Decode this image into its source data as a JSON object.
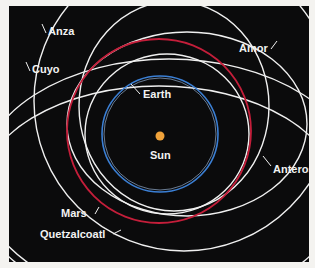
{
  "diagram": {
    "colors": {
      "background": "#0b0b0c",
      "page": "#f4f3f0",
      "earth_orbit": "#3b7fd4",
      "mars_orbit": "#c41e3a",
      "asteroid_orbit": "#f0f0f0",
      "sun": "#f0a23a",
      "label": "#f2f2f2"
    },
    "bodies": [
      {
        "name": "Sun",
        "label": "Sun",
        "type": "star"
      },
      {
        "name": "Earth",
        "label": "Earth",
        "type": "planet-orbit"
      },
      {
        "name": "Mars",
        "label": "Mars",
        "type": "planet-orbit"
      },
      {
        "name": "Anza",
        "label": "Anza",
        "type": "asteroid-orbit"
      },
      {
        "name": "Amor",
        "label": "Amor",
        "type": "asteroid-orbit"
      },
      {
        "name": "Cuyo",
        "label": "Cuyo",
        "type": "asteroid-orbit"
      },
      {
        "name": "Anteros",
        "label": "Anteros",
        "type": "asteroid-orbit"
      },
      {
        "name": "Quetzalcoatl",
        "label": "Quetzalcoatl",
        "type": "asteroid-orbit"
      }
    ]
  }
}
